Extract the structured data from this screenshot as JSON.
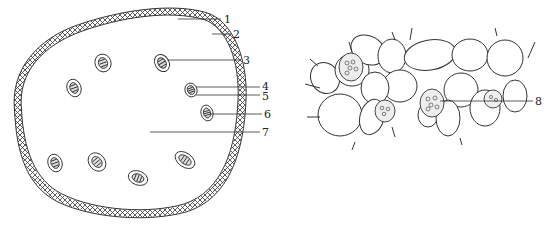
{
  "figure": {
    "left_panel": {
      "description": "Cross-section of stem with hatched outer layer and scattered vascular bundles",
      "labels": [
        {
          "id": "1",
          "text": "1",
          "x": 223,
          "y": 18
        },
        {
          "id": "2",
          "text": "2",
          "x": 233,
          "y": 34
        },
        {
          "id": "3",
          "text": "3",
          "x": 243,
          "y": 60
        },
        {
          "id": "4",
          "text": "4",
          "x": 262,
          "y": 84
        },
        {
          "id": "5",
          "text": "5",
          "x": 262,
          "y": 94
        },
        {
          "id": "6",
          "text": "6",
          "x": 264,
          "y": 113
        },
        {
          "id": "7",
          "text": "7",
          "x": 262,
          "y": 130
        }
      ]
    },
    "right_panel": {
      "description": "Enlarged parenchyma tissue with cells containing granules",
      "labels": [
        {
          "id": "8",
          "text": "8",
          "x": 535,
          "y": 99
        }
      ]
    },
    "colors": {
      "line": "#333333",
      "background": "#ffffff"
    }
  }
}
